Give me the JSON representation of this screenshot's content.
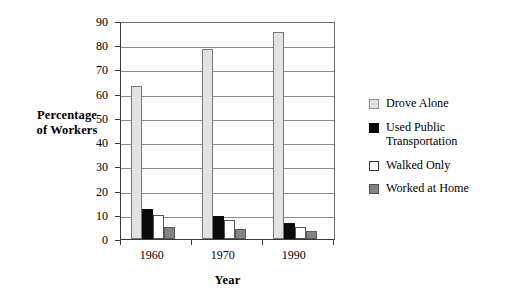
{
  "chart_data": {
    "type": "bar",
    "title": "",
    "xlabel": "Year",
    "ylabel": "Percentage\nof Workers",
    "ylabel_line1": "Percentage",
    "ylabel_line2": "of Workers",
    "categories": [
      "1960",
      "1970",
      "1990"
    ],
    "ylim": [
      0,
      90
    ],
    "ytick_step": 10,
    "yticks": [
      "90",
      "80",
      "70",
      "60",
      "50",
      "40",
      "30",
      "20",
      "10",
      "0"
    ],
    "grid": true,
    "legend_position": "right",
    "series": [
      {
        "name": "Drove Alone",
        "color": "#e2e2e2",
        "values": [
          63,
          78.5,
          85.5
        ]
      },
      {
        "name": "Used Public Transportation",
        "legend_text": "Used Public\nTransportation",
        "color": "#0b0b0b",
        "values": [
          12.5,
          9.5,
          6.5
        ]
      },
      {
        "name": "Walked Only",
        "color": "#ffffff",
        "values": [
          10,
          8,
          5
        ]
      },
      {
        "name": "Worked at Home",
        "color": "#848484",
        "values": [
          5,
          4,
          3.5
        ]
      }
    ]
  }
}
